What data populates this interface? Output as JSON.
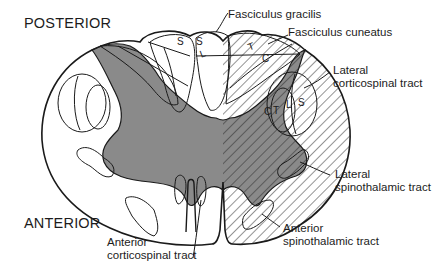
{
  "diagram": {
    "orientation": {
      "posterior": "POSTERIOR",
      "anterior": "ANTERIOR"
    },
    "labels": {
      "fasciculus_gracilis": "Fasciculus gracilis",
      "fasciculus_cuneatus": "Fasciculus cuneatus",
      "lateral_corticospinal_line1": "Lateral",
      "lateral_corticospinal_line2": "corticospinal tract",
      "lateral_spinothalamic_line1": "Lateral",
      "lateral_spinothalamic_line2": "spinothalamic tract",
      "anterior_spinothalamic_line1": "Anterior",
      "anterior_spinothalamic_line2": "spinothalamic tract",
      "anterior_corticospinal_line1": "Anterior",
      "anterior_corticospinal_line2": "corticospinal tract"
    },
    "somatotopic_letters": {
      "gracilis_S_left": "S",
      "gracilis_S_right": "S",
      "gracilis_L": "L",
      "cuneatus_T": "T",
      "cuneatus_C": "C",
      "lcst_C": "C",
      "lcst_T": "T",
      "lcst_L": "L",
      "lcst_S": "S"
    },
    "colors": {
      "outline": "#1a1a1a",
      "grey_matter": "#8a8a8a",
      "hatch": "#2a2a2a",
      "background": "#ffffff"
    }
  }
}
